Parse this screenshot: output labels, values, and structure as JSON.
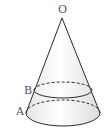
{
  "figure": {
    "type": "cone-frustum-diagram",
    "labels": {
      "apex": "O",
      "upper_point": "B",
      "lower_point": "A"
    },
    "colors": {
      "stroke": "#2a2a2a",
      "label": "#555555",
      "fill_light": "#ffffff",
      "fill_shade": "#e9e9e9"
    }
  }
}
